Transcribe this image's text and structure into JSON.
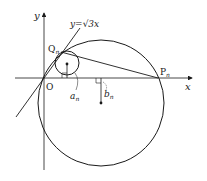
{
  "diagram": {
    "labels": {
      "y_axis": "y",
      "x_axis": "x",
      "origin": "O",
      "line_equation": "y=√3x",
      "point_Q": "Q",
      "point_Q_sub": "n",
      "point_P": "P",
      "point_P_sub": "n",
      "dist_a": "a",
      "dist_a_sub": "n",
      "dist_b": "b",
      "dist_b_sub": "n"
    },
    "colors": {
      "stroke": "#1a1a1a",
      "background": "#ffffff"
    }
  }
}
